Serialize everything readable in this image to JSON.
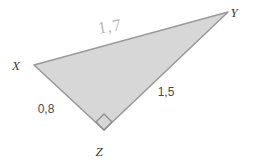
{
  "figure": {
    "kind": "right-triangle-diagram",
    "canvas": {
      "width": 253,
      "height": 161,
      "background": "#ffffff"
    },
    "style": {
      "fill": "#d7d7d7",
      "stroke": "#9a9a9a",
      "stroke_width": 1.6,
      "right_angle_marker_stroke": "#8d8d8d",
      "vertex_label_color": "#3b3b3b",
      "side_label_color": "#4a4a4a",
      "hand_label_color": "#b9b9b9"
    },
    "vertices": [
      {
        "name": "X",
        "label": "X",
        "x": 34,
        "y": 65,
        "label_x": 16,
        "label_y": 67
      },
      {
        "name": "Y",
        "label": "Y",
        "x": 228,
        "y": 12,
        "label_x": 234,
        "label_y": 14
      },
      {
        "name": "Z",
        "label": "Z",
        "x": 104,
        "y": 130,
        "label_x": 99,
        "label_y": 153
      }
    ],
    "sides": [
      {
        "name": "XY",
        "from": "X",
        "to": "Y",
        "label": "1,7",
        "label_x": 110,
        "label_y": 28,
        "label_rotation": -9,
        "style": "handwritten"
      },
      {
        "name": "XZ",
        "from": "X",
        "to": "Z",
        "label": "0,8",
        "label_x": 46,
        "label_y": 110,
        "label_rotation": 0,
        "style": "printed"
      },
      {
        "name": "ZY",
        "from": "Z",
        "to": "Y",
        "label": "1,5",
        "label_x": 166,
        "label_y": 93,
        "label_rotation": 0,
        "style": "printed"
      }
    ],
    "right_angle": {
      "at_vertex": "Z",
      "marker": "square",
      "size": 11,
      "points": "104,130 96,122 104,114 112,122"
    }
  }
}
